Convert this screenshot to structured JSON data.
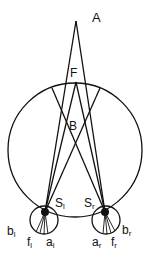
{
  "diagram": {
    "points": {
      "A": {
        "label": "A"
      },
      "F": {
        "label": "F"
      },
      "B": {
        "label": "B"
      }
    },
    "left_eye": {
      "nodal": {
        "label": "S",
        "sub": "l"
      },
      "b": {
        "label": "b",
        "sub": "l"
      },
      "f": {
        "label": "f",
        "sub": "l"
      },
      "a": {
        "label": "a",
        "sub": "l"
      }
    },
    "right_eye": {
      "nodal": {
        "label": "S",
        "sub": "r"
      },
      "b": {
        "label": "b",
        "sub": "r"
      },
      "f": {
        "label": "f",
        "sub": "r"
      },
      "a": {
        "label": "a",
        "sub": "r"
      }
    },
    "colors": {
      "stroke": "#111111",
      "background": "#ffffff"
    }
  }
}
